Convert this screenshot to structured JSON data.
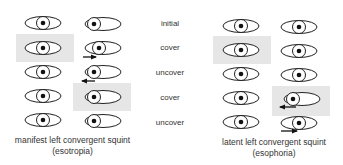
{
  "steps": [
    "initial",
    "cover",
    "uncover",
    "cover",
    "uncover"
  ],
  "panels": [
    {
      "caption_line1": "manifest left convergent squint",
      "caption_line2": "(esotropia)",
      "rows": [
        {
          "right_eye": "center",
          "left_eye": "deviated-in",
          "covered": "none",
          "arrow": "none"
        },
        {
          "right_eye": "center",
          "left_eye": "moving-out",
          "covered": "right",
          "arrow": "right"
        },
        {
          "right_eye": "center",
          "left_eye": "deviated-in",
          "covered": "none",
          "arrow": "left"
        },
        {
          "right_eye": "center",
          "left_eye": "deviated-in",
          "covered": "left",
          "arrow": "none"
        },
        {
          "right_eye": "center",
          "left_eye": "deviated-in",
          "covered": "none",
          "arrow": "none"
        }
      ]
    },
    {
      "caption_line1": "latent left convergent squint",
      "caption_line2": "(esophoria)",
      "rows": [
        {
          "right_eye": "center",
          "left_eye": "center",
          "covered": "none",
          "arrow": "none"
        },
        {
          "right_eye": "center",
          "left_eye": "center",
          "covered": "right",
          "arrow": "none"
        },
        {
          "right_eye": "center",
          "left_eye": "center",
          "covered": "none",
          "arrow": "none"
        },
        {
          "right_eye": "center",
          "left_eye": "deviated-in",
          "covered": "left",
          "arrow": "left"
        },
        {
          "right_eye": "center",
          "left_eye": "center",
          "covered": "none",
          "arrow": "right"
        }
      ]
    }
  ],
  "colors": {
    "shade": "#e6e6e6",
    "line": "#222222",
    "text": "#333333"
  }
}
